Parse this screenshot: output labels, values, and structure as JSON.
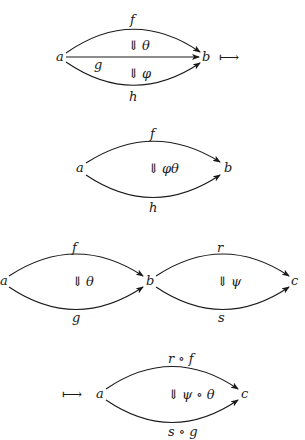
{
  "diagrams": [
    {
      "id": "vertical-composite-source",
      "objects": {
        "a": "a",
        "b": "b"
      },
      "morphisms": {
        "top": "f",
        "middle": "g",
        "bottom": "h"
      },
      "two_cells": {
        "upper": "θ",
        "lower": "φ"
      },
      "maps_to": "⟼"
    },
    {
      "id": "vertical-composite-result",
      "objects": {
        "a": "a",
        "b": "b"
      },
      "morphisms": {
        "top": "f",
        "bottom": "h"
      },
      "two_cells": {
        "main": "φθ"
      }
    },
    {
      "id": "horizontal-composite-source",
      "objects": {
        "a": "a",
        "b": "b",
        "c": "c"
      },
      "morphisms": {
        "left_top": "f",
        "left_bottom": "g",
        "right_top": "r",
        "right_bottom": "s"
      },
      "two_cells": {
        "left": "θ",
        "right": "ψ"
      }
    },
    {
      "id": "horizontal-composite-result",
      "maps_to": "⟼",
      "objects": {
        "a": "a",
        "c": "c"
      },
      "morphisms": {
        "top": "r ∘ f",
        "bottom": "s ∘ g"
      },
      "two_cells": {
        "main": "ψ ∘ θ"
      }
    }
  ],
  "symbols": {
    "double_down_arrow": "⇓"
  }
}
